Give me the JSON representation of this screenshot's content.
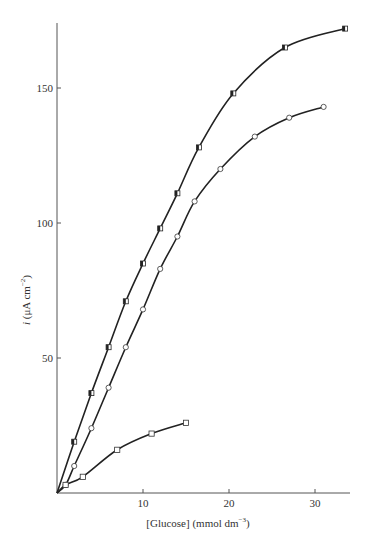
{
  "chart_data": {
    "type": "line",
    "title": "",
    "xlabel": "[Glucose] (mmol dm",
    "xlabel_sup": "−3",
    "xlabel_end": ")",
    "ylabel_italic": "i",
    "ylabel": " (μA cm",
    "ylabel_sup": "−2",
    "ylabel_end": ")",
    "xlim": [
      0,
      34
    ],
    "ylim": [
      0,
      175
    ],
    "xticks": [
      10,
      20,
      30
    ],
    "xtick_labels": [
      "10",
      "20",
      "30"
    ],
    "yticks": [
      50,
      100,
      150
    ],
    "ytick_labels": [
      "50",
      "100",
      "150"
    ],
    "grid": false,
    "legend": "none",
    "series": [
      {
        "name": "half-filled squares",
        "marker": "half-filled-square",
        "x": [
          0,
          2,
          4,
          6,
          8,
          10,
          12,
          14,
          16.5,
          20.5,
          26.5,
          33.5
        ],
        "y": [
          0,
          19,
          37,
          54,
          71,
          85,
          98,
          111,
          128,
          148,
          165,
          172
        ]
      },
      {
        "name": "open circles",
        "marker": "open-circle",
        "x": [
          0,
          1,
          2,
          4,
          6,
          8,
          10,
          12,
          14,
          16,
          19,
          23,
          27,
          31
        ],
        "y": [
          0,
          3,
          10,
          24,
          39,
          54,
          68,
          83,
          95,
          108,
          120,
          132,
          139,
          143
        ]
      },
      {
        "name": "open squares",
        "marker": "open-square",
        "x": [
          0,
          1,
          3,
          7,
          11,
          15
        ],
        "y": [
          0,
          3,
          6,
          16,
          22,
          26
        ]
      }
    ]
  }
}
